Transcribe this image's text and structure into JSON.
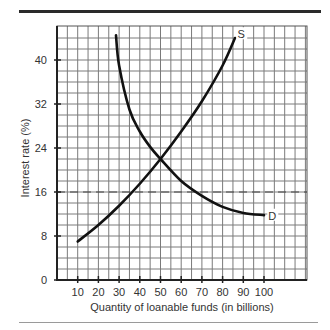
{
  "chart_data": {
    "type": "line",
    "title": "",
    "xlabel": "Quantity of loanable funds (in billions)",
    "ylabel": "Interest rate (%)",
    "xlim": [
      0,
      120
    ],
    "ylim": [
      0,
      46
    ],
    "grid": true,
    "x_ticks": [
      10,
      20,
      30,
      40,
      50,
      60,
      70,
      80,
      90,
      100
    ],
    "y_ticks": [
      0,
      8,
      16,
      24,
      32,
      40
    ],
    "series": [
      {
        "name": "S",
        "label": "S",
        "description": "Supply of loanable funds",
        "points": [
          [
            10,
            7
          ],
          [
            20,
            10
          ],
          [
            30,
            13.5
          ],
          [
            40,
            17.5
          ],
          [
            50,
            22
          ],
          [
            60,
            27
          ],
          [
            70,
            32.5
          ],
          [
            80,
            39
          ],
          [
            86,
            44
          ]
        ]
      },
      {
        "name": "D",
        "label": "D",
        "description": "Demand for loanable funds",
        "points": [
          [
            28.5,
            44.5
          ],
          [
            30,
            39
          ],
          [
            35,
            31
          ],
          [
            40,
            27
          ],
          [
            45,
            24.2
          ],
          [
            50,
            22
          ],
          [
            60,
            18
          ],
          [
            70,
            15.3
          ],
          [
            80,
            13.3
          ],
          [
            90,
            12.2
          ],
          [
            100,
            11.8
          ]
        ]
      }
    ],
    "reference_lines": [
      {
        "type": "horizontal",
        "y": 16,
        "style": "dashed"
      }
    ],
    "annotations": [
      {
        "text": "S",
        "x": 89,
        "y": 44.5
      },
      {
        "text": "D",
        "x": 104,
        "y": 11.5
      }
    ],
    "equilibrium": {
      "x": 50,
      "y": 22
    }
  }
}
